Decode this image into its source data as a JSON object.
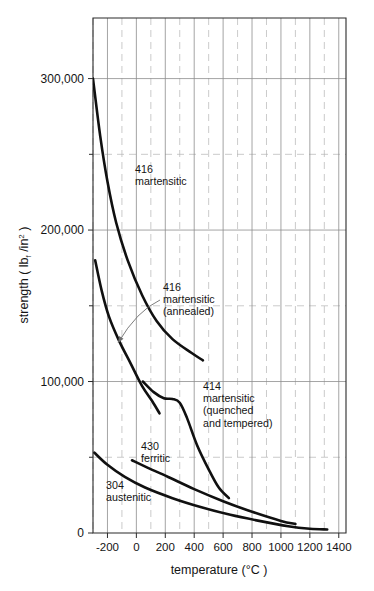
{
  "figure": {
    "background_color": "#ffffff",
    "curve_color": "#101010",
    "grid_color": "#8d8d8d",
    "axis_color": "#2b2b2b"
  },
  "chart_data": {
    "type": "line",
    "title": "",
    "xlabel": "temperature  (°C )",
    "ylabel": "strength  ( lb",
    "ylabel_sub": "f",
    "ylabel_mid": " /in",
    "ylabel_sup": "2",
    "ylabel_end": " )",
    "xlim": [
      -300,
      1450
    ],
    "ylim": [
      0,
      340000
    ],
    "grid": true,
    "legend": "inline-annotations",
    "x_ticks": [
      -200,
      0,
      200,
      400,
      600,
      800,
      1000,
      1200,
      1400
    ],
    "x_tick_labels": [
      "-200",
      "0",
      "200",
      "400",
      "600",
      "800",
      "1000",
      "1200",
      "1400"
    ],
    "y_ticks": [
      0,
      100000,
      200000,
      300000
    ],
    "y_tick_labels": [
      "0",
      "100,000",
      "200,000",
      "300,000"
    ],
    "y_minor_ticks": [
      50000,
      150000,
      250000
    ],
    "series": [
      {
        "name": "416 martensitic",
        "label_lines": [
          "416",
          "martensitic"
        ],
        "label_x": 135,
        "label_y": 173,
        "points": [
          [
            -300,
            300000
          ],
          [
            -250,
            262000
          ],
          [
            -200,
            232000
          ],
          [
            -140,
            205000
          ],
          [
            -60,
            180000
          ],
          [
            40,
            157000
          ],
          [
            140,
            140000
          ],
          [
            250,
            128000
          ],
          [
            380,
            119000
          ],
          [
            460,
            114000
          ]
        ]
      },
      {
        "name": "416 martensitic (annealed)",
        "label_lines": [
          "416",
          "martensitic",
          "(annealed)"
        ],
        "label_x": 163,
        "label_y": 291,
        "leader_from": [
          160,
          300
        ],
        "leader_to": [
          118,
          343
        ],
        "points": [
          [
            -285,
            180000
          ],
          [
            -240,
            160000
          ],
          [
            -190,
            143000
          ],
          [
            -120,
            127000
          ],
          [
            -40,
            112000
          ],
          [
            40,
            97000
          ],
          [
            110,
            87000
          ],
          [
            160,
            79000
          ]
        ]
      },
      {
        "name": "414 martensitic (quenched and tempered)",
        "label_lines": [
          "414",
          "martensitic",
          "(quenched",
          "and tempered)"
        ],
        "label_x": 203,
        "label_y": 390,
        "points": [
          [
            45,
            100000
          ],
          [
            120,
            93000
          ],
          [
            190,
            89000
          ],
          [
            250,
            88500
          ],
          [
            300,
            86000
          ],
          [
            350,
            76000
          ],
          [
            420,
            58000
          ],
          [
            500,
            42000
          ],
          [
            570,
            30000
          ],
          [
            640,
            23000
          ]
        ]
      },
      {
        "name": "430 ferritic",
        "label_lines": [
          "430",
          "ferritic"
        ],
        "label_x": 141,
        "label_y": 450,
        "points": [
          [
            -30,
            48000
          ],
          [
            80,
            43000
          ],
          [
            220,
            37000
          ],
          [
            400,
            29000
          ],
          [
            600,
            21000
          ],
          [
            800,
            14000
          ],
          [
            1000,
            8000
          ],
          [
            1100,
            6000
          ]
        ]
      },
      {
        "name": "304 austenitic",
        "label_lines": [
          "304",
          "austenitic"
        ],
        "label_x": 106,
        "label_y": 489,
        "points": [
          [
            -290,
            53000
          ],
          [
            -200,
            45000
          ],
          [
            -80,
            37000
          ],
          [
            60,
            30000
          ],
          [
            250,
            23000
          ],
          [
            450,
            17000
          ],
          [
            650,
            12000
          ],
          [
            850,
            8000
          ],
          [
            1050,
            4500
          ],
          [
            1200,
            2800
          ],
          [
            1320,
            2300
          ]
        ]
      }
    ]
  }
}
